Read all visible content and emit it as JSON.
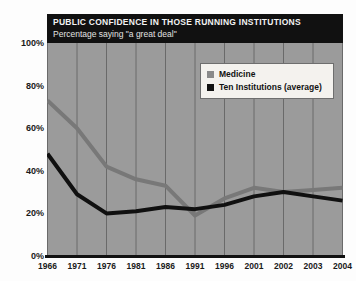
{
  "chart_data": {
    "type": "line",
    "title": "PUBLIC CONFIDENCE IN THOSE RUNNING INSTITUTIONS",
    "subtitle": "Percentage saying \"a great deal\"",
    "xlabel": "",
    "ylabel": "",
    "ylim": [
      0,
      100
    ],
    "grid": true,
    "legend_position": "top-right",
    "categories": [
      "1966",
      "1971",
      "1976",
      "1981",
      "1986",
      "1991",
      "1996",
      "2001",
      "2002",
      "2003",
      "2004"
    ],
    "ytick_labels": [
      "0%",
      "20%",
      "40%",
      "60%",
      "80%",
      "100%"
    ],
    "ytick_values": [
      0,
      20,
      40,
      60,
      80,
      100
    ],
    "series": [
      {
        "name": "Medicine",
        "color": "#787878",
        "values": [
          73,
          60,
          42,
          36,
          33,
          19,
          27,
          32,
          30,
          31,
          32
        ]
      },
      {
        "name": "Ten Institutions (average)",
        "color": "#101010",
        "values": [
          48,
          29,
          20,
          21,
          23,
          22,
          24,
          28,
          30,
          28,
          26
        ]
      }
    ]
  },
  "legend": {
    "items": [
      {
        "label": "Medicine",
        "color": "#8a8a8a"
      },
      {
        "label": "Ten Institutions (average)",
        "color": "#121212"
      }
    ]
  },
  "colors": {
    "plot_background": "#9b9b9b",
    "gridline": "#6a6a6a",
    "title_bar": "#111111",
    "title_text": "#f2f2f2",
    "axis": "#111111"
  }
}
